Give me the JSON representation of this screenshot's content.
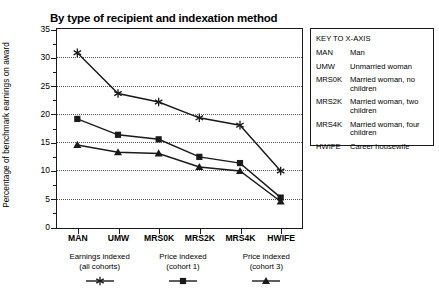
{
  "chart_data": {
    "type": "line",
    "title": "By type of recipient and indexation method",
    "xlabel": "",
    "ylabel": "Percentage of benchmark earnings on award",
    "categories": [
      "MAN",
      "UMW",
      "MRS0K",
      "MRS2K",
      "MRS4K",
      "HWIFE"
    ],
    "ylim": [
      0,
      35
    ],
    "yticks": [
      0,
      5,
      10,
      15,
      20,
      25,
      30,
      35
    ],
    "grid": true,
    "legend_position": "bottom",
    "series": [
      {
        "name": "Earnings indexed (all cohorts)",
        "marker": "star",
        "values": [
          30.8,
          23.6,
          22.1,
          19.3,
          18.0,
          9.9
        ]
      },
      {
        "name": "Price indexed (cohort 1)",
        "marker": "square",
        "values": [
          19.1,
          16.3,
          15.5,
          12.4,
          11.3,
          5.2
        ]
      },
      {
        "name": "Price indexed (cohort 3)",
        "marker": "triangle",
        "values": [
          14.5,
          13.2,
          13.0,
          10.6,
          9.9,
          4.5
        ]
      }
    ]
  },
  "series_legend": [
    {
      "line1": "Earnings indexed",
      "line2": "(all cohorts)",
      "marker": "star"
    },
    {
      "line1": "Price indexed",
      "line2": "(cohort 1)",
      "marker": "square"
    },
    {
      "line1": "Price indexed",
      "line2": "(cohort 3)",
      "marker": "triangle"
    }
  ],
  "key_box": {
    "title": "KEY TO X-AXIS",
    "rows": [
      {
        "code": "MAN",
        "desc": "Man"
      },
      {
        "code": "UMW",
        "desc": "Unmarried woman"
      },
      {
        "code": "MRS0K",
        "desc": "Married woman, no children"
      },
      {
        "code": "MRS2K",
        "desc": "Married woman, two children"
      },
      {
        "code": "MRS4K",
        "desc": "Married woman, four children"
      },
      {
        "code": "HWIFE",
        "desc": "Career housewife"
      }
    ]
  },
  "colors": {
    "ink": "#1a1a1a",
    "grid": "#555555",
    "background": "#ffffff"
  }
}
